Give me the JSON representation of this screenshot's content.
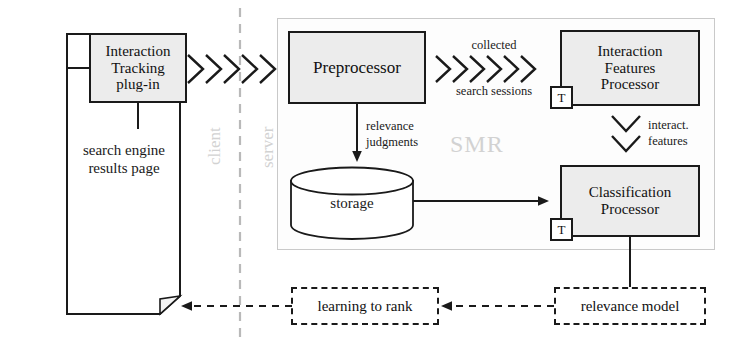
{
  "diagram": {
    "container_label": "SMR",
    "zones": {
      "client": "client",
      "server": "server"
    },
    "nodes": {
      "serp": "search engine\nresults page",
      "serp_line1": "search engine",
      "serp_line2": "results page",
      "tracking_plugin_line1": "Interaction",
      "tracking_plugin_line2": "Tracking",
      "tracking_plugin_line3": "plug-in",
      "preprocessor": "Preprocessor",
      "interaction_features_line1": "Interaction",
      "interaction_features_line2": "Features",
      "interaction_features_line3": "Processor",
      "classification_line1": "Classification",
      "classification_line2": "Processor",
      "storage": "storage",
      "learning_to_rank": "learning to rank",
      "relevance_model": "relevance model",
      "transform_badge": "T"
    },
    "edges": {
      "collected_line1": "collected",
      "collected_line2": "search sessions",
      "relevance_line1": "relevance",
      "relevance_line2": "judgments",
      "interact_line1": "interact.",
      "interact_line2": "features"
    }
  },
  "colors": {
    "ink": "#1a1a1a",
    "box_fill": "#ececec",
    "ghost_text": "#d2d2d2",
    "container_border": "#c9c9c9",
    "page_bg": "#ffffff"
  }
}
